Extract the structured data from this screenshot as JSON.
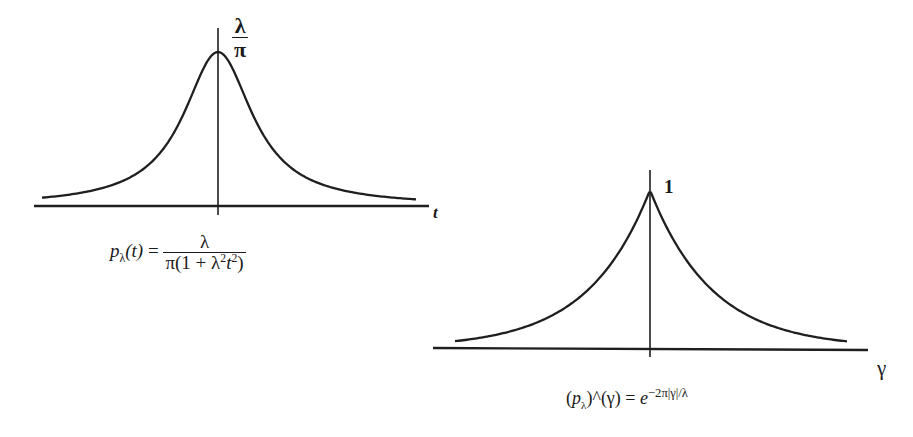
{
  "figure": {
    "left_panel": {
      "peak_label_num": "λ",
      "peak_label_den": "π",
      "axis_label": "t",
      "formula": {
        "lhs_func": "p",
        "lhs_sub": "λ",
        "lhs_arg": "(t)",
        "equals": "=",
        "numerator": "λ",
        "denominator_pre": "π(1 + λ",
        "denominator_sup1": "2",
        "denominator_mid": "t",
        "denominator_sup2": "2",
        "denominator_post": ")"
      }
    },
    "right_panel": {
      "peak_label": "1",
      "axis_label": "γ",
      "formula": {
        "open": "(",
        "func": "p",
        "sub": "λ",
        "close_hat": ")^",
        "arg": "(γ)",
        "equals": "=",
        "base": "e",
        "exponent": "−2π|γ|/λ"
      }
    }
  },
  "chart_data": [
    {
      "type": "line",
      "title": "",
      "description": "Cauchy (Lorentzian) kernel p_λ(t) = λ / (π(1 + λ²t²))",
      "xlabel": "t",
      "ylabel": "",
      "peak_annotation": "λ/π",
      "peak_x": 0,
      "shape": "smooth bell (Lorentzian), heavy tails",
      "grid": false,
      "x": [
        -4,
        -3,
        -2,
        -1.5,
        -1,
        -0.5,
        0,
        0.5,
        1,
        1.5,
        2,
        3,
        4
      ],
      "y_relative_to_peak": [
        0.059,
        0.1,
        0.2,
        0.308,
        0.5,
        0.8,
        1.0,
        0.8,
        0.5,
        0.308,
        0.2,
        0.1,
        0.059
      ]
    },
    {
      "type": "line",
      "title": "",
      "description": "Fourier transform (p_λ)^(γ) = e^{−2π|γ|/λ}",
      "xlabel": "γ",
      "ylabel": "",
      "peak_annotation": "1",
      "peak_x": 0,
      "peak_value": 1,
      "shape": "two-sided exponential with cusp at 0",
      "grid": false,
      "x": [
        -2,
        -1.5,
        -1,
        -0.5,
        -0.25,
        0,
        0.25,
        0.5,
        1,
        1.5,
        2
      ],
      "y": [
        0.05,
        0.105,
        0.22,
        0.47,
        0.68,
        1.0,
        0.68,
        0.47,
        0.22,
        0.105,
        0.05
      ]
    }
  ]
}
